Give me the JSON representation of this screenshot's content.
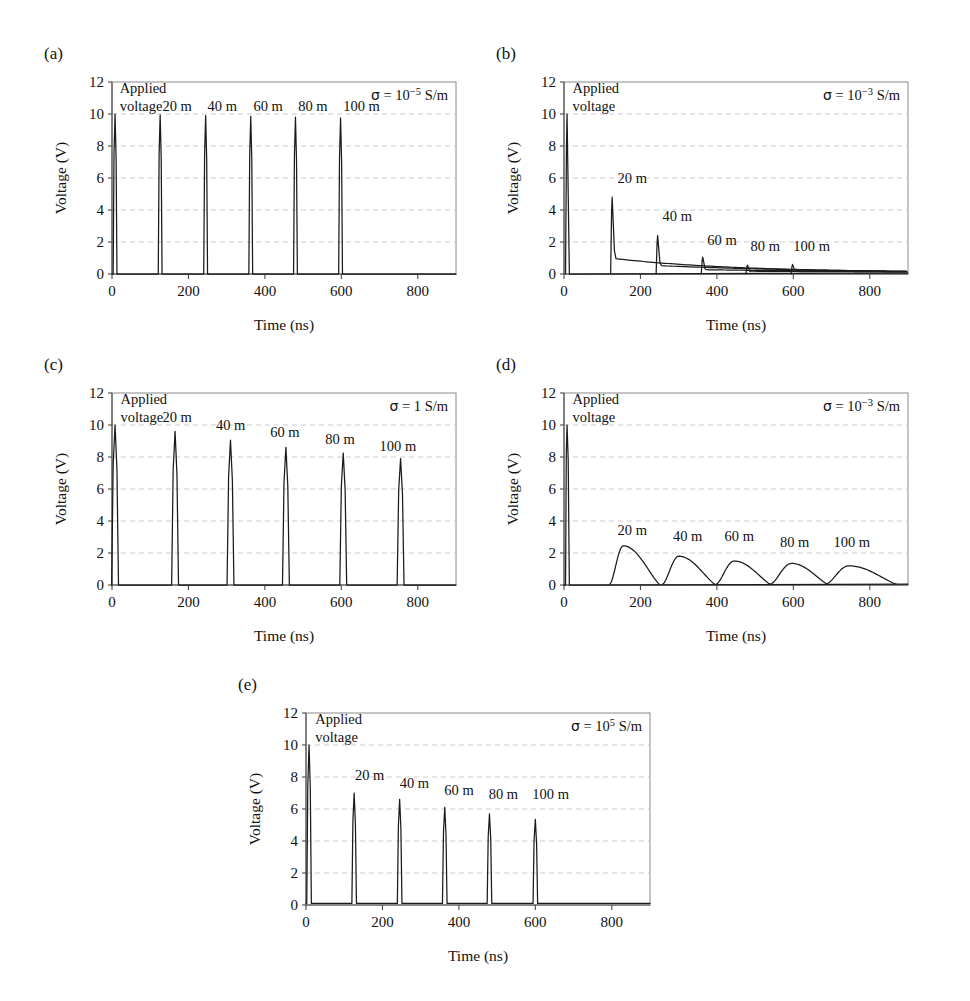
{
  "figure": {
    "type": "multi-panel-line-chart",
    "panels": [
      "a",
      "b",
      "c",
      "d",
      "e"
    ],
    "shared": {
      "xlabel": "Time (ns)",
      "ylabel": "Voltage (V)",
      "xlim": [
        0,
        900
      ],
      "ylim": [
        0,
        12
      ],
      "xticks": [
        0,
        200,
        400,
        600,
        800
      ],
      "yticks": [
        0,
        2,
        4,
        6,
        8,
        10,
        12
      ],
      "xtick_labels": [
        "0",
        "200",
        "400",
        "600",
        "800"
      ],
      "ytick_labels": [
        "0",
        "2",
        "4",
        "6",
        "8",
        "10",
        "12"
      ],
      "grid": "horizontal-dashed",
      "legend": "none",
      "annotation_applied": [
        "Applied",
        "voltage"
      ],
      "sigma_prefix": "σ = ",
      "sigma_unit": " S/m"
    }
  },
  "chart_data": [
    {
      "id": "a",
      "type": "line",
      "panel_label": "(a)",
      "title": "",
      "xlabel": "Time (ns)",
      "ylabel": "Voltage (V)",
      "xlim": [
        0,
        900
      ],
      "ylim": [
        0,
        12
      ],
      "xticks": [
        0,
        200,
        400,
        600,
        800
      ],
      "yticks": [
        0,
        2,
        4,
        6,
        8,
        10,
        12
      ],
      "sigma_label": "σ = 10⁻⁵ S/m",
      "sigma_mantissa": "10",
      "sigma_exponent": "−5",
      "annotations": [
        {
          "text": "Applied",
          "x": 20,
          "y": 11.3
        },
        {
          "text": "voltage",
          "x": 20,
          "y": 10.2
        },
        {
          "text": "20 m",
          "x": 132,
          "y": 10.2
        },
        {
          "text": "40 m",
          "x": 250,
          "y": 10.2
        },
        {
          "text": "60 m",
          "x": 370,
          "y": 10.2
        },
        {
          "text": "80 m",
          "x": 487,
          "y": 10.2
        },
        {
          "text": "100 m",
          "x": 605,
          "y": 10.2
        }
      ],
      "pulse_centers_ns": [
        8,
        126,
        245,
        363,
        480,
        598
      ],
      "pulse_peaks_v": [
        10.0,
        9.95,
        9.9,
        9.85,
        9.8,
        9.75
      ],
      "pulse_halfwidth_ns": 5,
      "baseline_v": 0.0,
      "description": "Six narrow rectangular-ish pulses of ~10 V, no decay tail"
    },
    {
      "id": "b",
      "type": "line",
      "panel_label": "(b)",
      "title": "",
      "xlabel": "Time (ns)",
      "ylabel": "Voltage (V)",
      "xlim": [
        0,
        900
      ],
      "ylim": [
        0,
        12
      ],
      "xticks": [
        0,
        200,
        400,
        600,
        800
      ],
      "yticks": [
        0,
        2,
        4,
        6,
        8,
        10,
        12
      ],
      "sigma_label": "σ = 10⁻³ S/m",
      "sigma_mantissa": "10",
      "sigma_exponent": "−3",
      "annotations": [
        {
          "text": "Applied",
          "x": 22,
          "y": 11.3
        },
        {
          "text": "voltage",
          "x": 22,
          "y": 10.2
        },
        {
          "text": "20 m",
          "x": 140,
          "y": 5.7
        },
        {
          "text": "40 m",
          "x": 258,
          "y": 3.3
        },
        {
          "text": "60 m",
          "x": 375,
          "y": 1.8
        },
        {
          "text": "80 m",
          "x": 488,
          "y": 1.45
        },
        {
          "text": "100 m",
          "x": 600,
          "y": 1.45
        }
      ],
      "pulse_centers_ns": [
        8,
        126,
        245,
        363,
        480,
        598
      ],
      "pulse_peaks_v": [
        10.0,
        4.8,
        2.4,
        1.05,
        0.55,
        0.6
      ],
      "tail_decay_ns": [
        0,
        150,
        200,
        260,
        320,
        380
      ],
      "baseline_v": 0.0,
      "description": "Sharp peaks each followed by a slow exponential decay tail; amplitudes fall rapidly"
    },
    {
      "id": "c",
      "type": "line",
      "panel_label": "(c)",
      "title": "",
      "xlabel": "Time (ns)",
      "ylabel": "Voltage (V)",
      "xlim": [
        0,
        900
      ],
      "ylim": [
        0,
        12
      ],
      "xticks": [
        0,
        200,
        400,
        600,
        800
      ],
      "yticks": [
        0,
        2,
        4,
        6,
        8,
        10,
        12
      ],
      "sigma_label": "σ = 1 S/m",
      "sigma_mantissa": "1",
      "sigma_exponent": "",
      "annotations": [
        {
          "text": "Applied",
          "x": 22,
          "y": 11.3
        },
        {
          "text": "voltage",
          "x": 22,
          "y": 10.2
        },
        {
          "text": "20 m",
          "x": 132,
          "y": 10.2
        },
        {
          "text": "40 m",
          "x": 272,
          "y": 9.7
        },
        {
          "text": "60 m",
          "x": 414,
          "y": 9.25
        },
        {
          "text": "80 m",
          "x": 558,
          "y": 8.8
        },
        {
          "text": "100 m",
          "x": 700,
          "y": 8.4
        }
      ],
      "pulse_centers_ns": [
        8,
        165,
        310,
        455,
        605,
        755
      ],
      "pulse_peaks_v": [
        10.0,
        9.6,
        9.05,
        8.6,
        8.25,
        7.9
      ],
      "pulse_halfwidth_ns": 9,
      "baseline_v": 0.0,
      "description": "Six spread-out narrow peaks with gradually decreasing amplitude and wider spacing"
    },
    {
      "id": "d",
      "type": "line",
      "panel_label": "(d)",
      "title": "",
      "xlabel": "Time (ns)",
      "ylabel": "Voltage (V)",
      "xlim": [
        0,
        900
      ],
      "ylim": [
        0,
        12
      ],
      "xticks": [
        0,
        200,
        400,
        600,
        800
      ],
      "yticks": [
        0,
        2,
        4,
        6,
        8,
        10,
        12
      ],
      "sigma_label": "σ = 10⁻³ S/m",
      "sigma_mantissa": "10",
      "sigma_exponent": "−3",
      "annotations": [
        {
          "text": "Applied",
          "x": 22,
          "y": 11.3
        },
        {
          "text": "voltage",
          "x": 22,
          "y": 10.2
        },
        {
          "text": "20 m",
          "x": 140,
          "y": 3.15
        },
        {
          "text": "40 m",
          "x": 285,
          "y": 2.75
        },
        {
          "text": "60 m",
          "x": 420,
          "y": 2.75
        },
        {
          "text": "80 m",
          "x": 565,
          "y": 2.35
        },
        {
          "text": "100 m",
          "x": 705,
          "y": 2.35
        }
      ],
      "initial_pulse": {
        "center_ns": 8,
        "peak_v": 10.0
      },
      "hump_centers_ns": [
        155,
        300,
        445,
        595,
        745
      ],
      "hump_peaks_v": [
        2.4,
        1.75,
        1.45,
        1.3,
        1.15
      ],
      "hump_start_ns": [
        120,
        258,
        398,
        540,
        685
      ],
      "hump_end_ns": [
        250,
        395,
        540,
        690,
        870
      ],
      "baseline_v": 0.0,
      "description": "Initial 10 V spike then five broad asymmetric humps of decreasing height"
    },
    {
      "id": "e",
      "type": "line",
      "panel_label": "(e)",
      "title": "",
      "xlabel": "Time (ns)",
      "ylabel": "Voltage (V)",
      "xlim": [
        0,
        900
      ],
      "ylim": [
        0,
        12
      ],
      "xticks": [
        0,
        200,
        400,
        600,
        800
      ],
      "yticks": [
        0,
        2,
        4,
        6,
        8,
        10,
        12
      ],
      "sigma_label": "σ = 10⁵ S/m",
      "sigma_mantissa": "10",
      "sigma_exponent": "5",
      "annotations": [
        {
          "text": "Applied",
          "x": 24,
          "y": 11.3
        },
        {
          "text": "voltage",
          "x": 24,
          "y": 10.2
        },
        {
          "text": "20 m",
          "x": 128,
          "y": 7.8
        },
        {
          "text": "40 m",
          "x": 245,
          "y": 7.3
        },
        {
          "text": "60 m",
          "x": 362,
          "y": 6.9
        },
        {
          "text": "80 m",
          "x": 478,
          "y": 6.6
        },
        {
          "text": "100 m",
          "x": 592,
          "y": 6.6
        }
      ],
      "pulse_centers_ns": [
        8,
        126,
        245,
        363,
        480,
        600
      ],
      "pulse_peaks_v": [
        10.0,
        7.0,
        6.6,
        6.1,
        5.7,
        5.35
      ],
      "pulse_halfwidth_ns": 6,
      "baseline_v": 0.1,
      "description": "Six narrow pulses with steadily decreasing amplitude on a small non-zero baseline"
    }
  ]
}
